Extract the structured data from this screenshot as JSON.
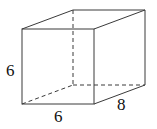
{
  "diagram": {
    "type": "rectangular-prism",
    "colors": {
      "stroke": "#3a3a3a",
      "text": "#111111",
      "background": "#ffffff"
    },
    "labels": {
      "height": "6",
      "width": "6",
      "depth": "8"
    },
    "vertices": {
      "front_top_left": [
        22,
        29
      ],
      "front_top_right": [
        94,
        29
      ],
      "front_bottom_left": [
        22,
        104
      ],
      "front_bottom_right": [
        94,
        104
      ],
      "back_top_left": [
        73,
        10
      ],
      "back_top_right": [
        145,
        10
      ],
      "back_bottom_left": [
        73,
        85
      ],
      "back_bottom_right": [
        145,
        85
      ]
    }
  }
}
